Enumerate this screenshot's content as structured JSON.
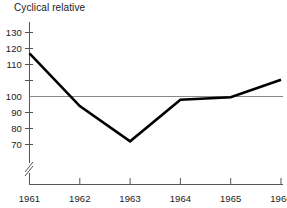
{
  "chart_data": {
    "type": "line",
    "title": "Cyclical relative",
    "xlabel": "",
    "ylabel": "",
    "categories": [
      "1961",
      "1962",
      "1963",
      "1964",
      "1965",
      "1966"
    ],
    "x": [
      1961,
      1962,
      1963,
      1964,
      1965,
      1966
    ],
    "values": [
      127,
      94,
      72,
      98,
      99.5,
      110.5
    ],
    "series": [
      {
        "name": "Cyclical relative",
        "values": [
          127,
          94,
          72,
          98,
          99.5,
          110.5
        ]
      }
    ],
    "ylim": [
      64,
      134
    ],
    "xlim": [
      1961,
      1966
    ],
    "yticks": [
      70,
      80,
      90,
      100,
      110,
      120,
      130
    ],
    "ytick_labels": [
      "70",
      "80",
      "90",
      "100",
      "110",
      "120",
      "130"
    ],
    "xtick_labels": [
      "1961",
      "1962",
      "1963",
      "1964",
      "1965",
      "1966"
    ],
    "grid": false,
    "legend": false,
    "legend_position": "none",
    "reference_line": {
      "value": 100,
      "orientation": "horizontal",
      "color": "#888888"
    },
    "axis_break": {
      "axis": "y",
      "below": 70,
      "symbol": "//"
    },
    "colors": {
      "line": "#000000",
      "axis": "#555555",
      "reference": "#888888",
      "text": "#1a1a1a",
      "background": "#ffffff"
    },
    "line_width": 2.6
  }
}
